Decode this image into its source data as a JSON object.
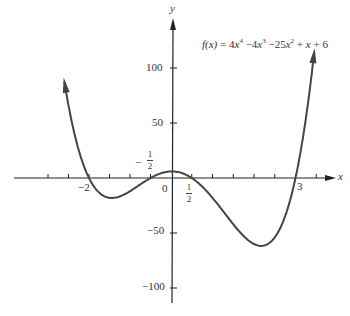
{
  "chart_data": {
    "type": "line",
    "title": "",
    "function_label": "f(x) = 4x^4 - 4x^3 - 25x^2 + x + 6",
    "coefficients": [
      4,
      -4,
      -25,
      1,
      6
    ],
    "xlabel": "x",
    "ylabel": "y",
    "x_range": [
      -2.6,
      3.45
    ],
    "xlim": [
      -4.1,
      4.2
    ],
    "ylim": [
      -115,
      140
    ],
    "x_tick_step": 0.5,
    "x_tick_labels": [
      "-2",
      "0",
      "1/2",
      "3"
    ],
    "x_annotations": [
      "-1/2"
    ],
    "y_tick_labels": [
      "100",
      "50",
      "-50",
      "-100"
    ],
    "y_ticks": [
      100,
      50,
      -50,
      -100
    ],
    "roots": [
      -2,
      -0.5,
      0.5,
      3
    ],
    "grid": false,
    "legend": "none",
    "line_color": "#444444",
    "axis_color": "#222222"
  },
  "labels": {
    "y_axis": "y",
    "x_axis": "x",
    "origin": "0",
    "neg_two": "−2",
    "three": "3",
    "y100": "100",
    "y50": "50",
    "yneg50": "−50",
    "yneg100": "−100",
    "half_num": "1",
    "half_den": "2",
    "neg_sign": "−",
    "formula_fx": "f(x)",
    "formula_eq": " = 4",
    "formula_x": "x",
    "formula_p4": "4",
    "formula_m4": " −4",
    "formula_p3": "3",
    "formula_m25": " −25",
    "formula_p2": "2",
    "formula_tail": " + ",
    "formula_x2": "x",
    "formula_six": " + 6"
  }
}
